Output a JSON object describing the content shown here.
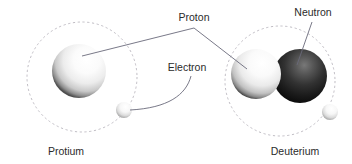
{
  "figure": {
    "title_visible": false,
    "background_color": "#ffffff",
    "width": 352,
    "height": 164
  },
  "labels": {
    "proton": "Proton",
    "neutron": "Neutron",
    "electron": "Electron",
    "protium": "Protium",
    "deuterium": "Deuterium"
  },
  "colors": {
    "text": "#2b2b2b",
    "leader_line": "#6a6a7a",
    "orbit_dashed": "#b9b6bd",
    "proton_light": "#ffffff",
    "proton_mid": "#e8e8e8",
    "proton_shadow": "#4a4a4a",
    "neutron_dark": "#111111",
    "neutron_highlight": "#6f6f6f",
    "electron_light": "#ffffff",
    "electron_shadow": "#9a9a9a"
  },
  "atoms": [
    {
      "name": "protium",
      "caption": "Protium",
      "orbit": {
        "cx": 82,
        "cy": 77,
        "r": 55
      },
      "particles": [
        {
          "type": "proton",
          "cx": 79,
          "cy": 71,
          "r": 27
        },
        {
          "type": "electron",
          "cx": 124,
          "cy": 110,
          "r": 8
        }
      ]
    },
    {
      "name": "deuterium",
      "caption": "Deuterium",
      "orbit": {
        "cx": 280,
        "cy": 81,
        "r": 55
      },
      "particles": [
        {
          "type": "proton",
          "cx": 256,
          "cy": 74,
          "r": 25
        },
        {
          "type": "neutron",
          "cx": 300,
          "cy": 76,
          "r": 27
        },
        {
          "type": "electron",
          "cx": 330,
          "cy": 112,
          "r": 8
        }
      ]
    }
  ],
  "callouts": [
    {
      "label": "Proton",
      "text_x": 194,
      "text_y": 18,
      "targets": [
        [
          82,
          55
        ],
        [
          246,
          68
        ]
      ]
    },
    {
      "label": "Neutron",
      "text_x": 309,
      "text_y": 15,
      "targets": [
        [
          297,
          64
        ]
      ]
    },
    {
      "label": "Electron",
      "text_x": 190,
      "text_y": 72,
      "targets": [
        [
          128,
          110
        ]
      ]
    }
  ]
}
